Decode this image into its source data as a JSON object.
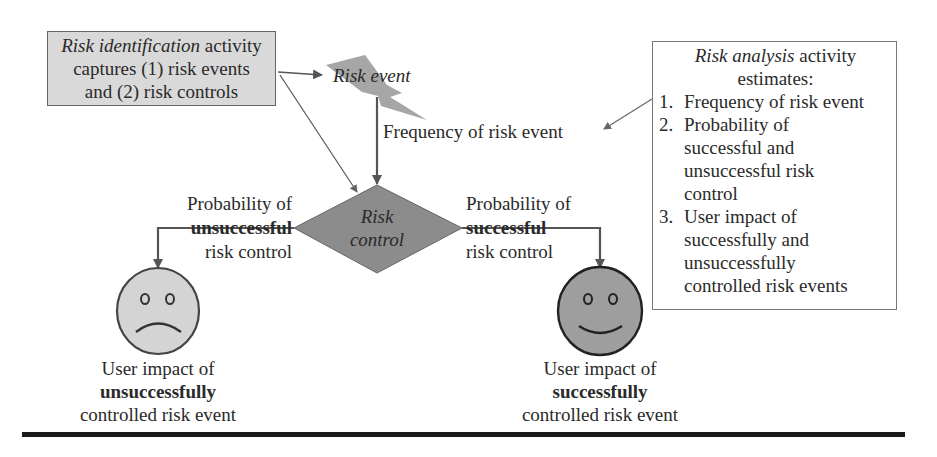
{
  "identification_box": {
    "italic": "Risk identification",
    "line1_rest": " activity",
    "line2": "captures (1) risk events",
    "line3": "and (2) risk controls"
  },
  "risk_event": {
    "label": "Risk event"
  },
  "frequency_label": "Frequency of risk event",
  "risk_control": {
    "line1": "Risk",
    "line2": "control"
  },
  "left_branch": {
    "line1": "Probability of",
    "line2_bold": "unsuccessful",
    "line3": "risk control"
  },
  "right_branch": {
    "line1": "Probability of",
    "line2_bold": "successful",
    "line3": "risk control"
  },
  "left_outcome": {
    "face": "sad-face",
    "line1": "User impact of",
    "line2_bold": "unsuccessfully",
    "line3": "controlled risk event"
  },
  "right_outcome": {
    "face": "happy-face",
    "line1": "User impact of",
    "line2_bold": "successfully",
    "line3": "controlled risk event"
  },
  "analysis_box": {
    "title_italic": "Risk analysis",
    "title_rest": " activity",
    "title_line2": "estimates:",
    "items": [
      {
        "num": "1.",
        "lines": [
          "Frequency of risk event"
        ]
      },
      {
        "num": "2.",
        "lines": [
          "Probability of",
          "successful and",
          "unsuccessful risk",
          "control"
        ]
      },
      {
        "num": "3.",
        "lines": [
          "User impact of",
          "successfully and",
          "unsuccessfully",
          "controlled risk events"
        ]
      }
    ]
  },
  "colors": {
    "id_box_fill": "#d9d9d9",
    "bolt_fill": "#a6a6a6",
    "diamond_fill": "#8c8c8c",
    "sad_face_fill": "#d4d4d4",
    "happy_face_fill": "#9e9e9e",
    "line": "#555555",
    "rule": "#1a1a1a"
  }
}
